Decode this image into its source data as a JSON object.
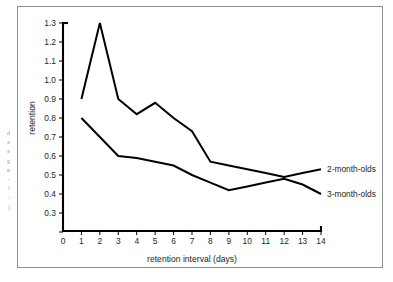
{
  "edge_text": {
    "lines": [
      "d",
      "e",
      "e",
      "g",
      "n",
      "-",
      "t",
      ":",
      ")"
    ]
  },
  "chart_data": {
    "type": "line",
    "title": "",
    "xlabel": "retention interval (days)",
    "ylabel": "retention",
    "x": [
      1,
      2,
      3,
      4,
      5,
      6,
      7,
      8,
      9,
      10,
      11,
      12,
      13,
      14
    ],
    "xlim": [
      0,
      14
    ],
    "ylim": [
      0.2,
      1.3
    ],
    "xticks": [
      "0",
      "1",
      "2",
      "3",
      "4",
      "5",
      "6",
      "7",
      "8",
      "9",
      "10",
      "11",
      "12",
      "13",
      "14"
    ],
    "yticks": [
      "0.3",
      "0.4",
      "0.5",
      "0.6",
      "0.7",
      "0.8",
      "0.9",
      "1.0",
      "1.1",
      "1.2",
      "1.3"
    ],
    "grid": false,
    "legend_position": "right-inline",
    "series": [
      {
        "name": "2-month-olds",
        "values": [
          0.9,
          1.3,
          0.9,
          0.82,
          0.88,
          0.8,
          0.73,
          0.57,
          0.55,
          0.53,
          0.51,
          0.49,
          0.51,
          0.53
        ]
      },
      {
        "name": "3-month-olds",
        "values": [
          0.8,
          0.7,
          0.6,
          0.59,
          0.57,
          0.55,
          0.5,
          0.46,
          0.42,
          0.44,
          0.46,
          0.48,
          0.45,
          0.4
        ]
      }
    ],
    "colors": {
      "line": "#000000",
      "axis": "#000000",
      "text": "#231f20",
      "frame": "#8d8d8d"
    }
  }
}
